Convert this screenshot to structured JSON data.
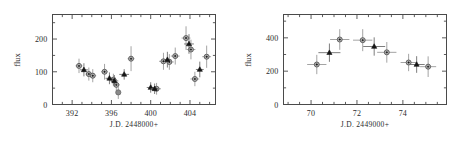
{
  "figure": {
    "background": "#ffffff",
    "panel_count": 2
  },
  "chart_data": [
    {
      "type": "scatter",
      "panel": "left",
      "title": "",
      "xlabel": "J.D. 2448000+",
      "ylabel": "flux",
      "xlim": [
        390.0,
        406.6
      ],
      "ylim": [
        0,
        275
      ],
      "xticks": [
        392,
        396,
        400,
        404
      ],
      "xticklabels": [
        "392",
        "396",
        "400",
        "404"
      ],
      "yticks": [
        0,
        100,
        200
      ],
      "yticklabels": [
        "0",
        "100",
        "200"
      ],
      "xminor_step": 1,
      "yminor_step": 50,
      "grid": false,
      "legend": null,
      "series": [
        {
          "name": "open-circle",
          "marker": "open-circle",
          "color": "#b3b3b3",
          "points": [
            {
              "x": 392.7,
              "y": 118,
              "yerr": 22,
              "xerr": 0.35
            },
            {
              "x": 393.7,
              "y": 93,
              "yerr": 20,
              "xerr": 0.35
            },
            {
              "x": 394.1,
              "y": 88,
              "yerr": 20,
              "xerr": 0.35
            },
            {
              "x": 395.3,
              "y": 100,
              "yerr": 24,
              "xerr": 0.35
            },
            {
              "x": 396.2,
              "y": 76,
              "yerr": 18,
              "xerr": 0.35
            },
            {
              "x": 396.5,
              "y": 60,
              "yerr": 18,
              "xerr": 0.35
            },
            {
              "x": 398.0,
              "y": 140,
              "yerr": 38,
              "xerr": 0.35
            },
            {
              "x": 400.6,
              "y": 48,
              "yerr": 18,
              "xerr": 0.45
            },
            {
              "x": 401.3,
              "y": 132,
              "yerr": 26,
              "xerr": 0.45
            },
            {
              "x": 401.9,
              "y": 130,
              "yerr": 24,
              "xerr": 0.45
            },
            {
              "x": 402.5,
              "y": 148,
              "yerr": 26,
              "xerr": 0.45
            },
            {
              "x": 403.6,
              "y": 203,
              "yerr": 36,
              "xerr": 0.45
            },
            {
              "x": 404.1,
              "y": 168,
              "yerr": 30,
              "xerr": 0.45
            },
            {
              "x": 404.5,
              "y": 78,
              "yerr": 22,
              "xerr": 0.45
            },
            {
              "x": 405.7,
              "y": 146,
              "yerr": 34,
              "xerr": 0.45
            }
          ]
        },
        {
          "name": "filled-triangle",
          "marker": "filled-triangle",
          "color": "#151515",
          "points": [
            {
              "x": 393.2,
              "y": 106,
              "yerr": 20,
              "xerr": 0.4
            },
            {
              "x": 395.8,
              "y": 80,
              "yerr": 18,
              "xerr": 0.4
            },
            {
              "x": 396.3,
              "y": 72,
              "yerr": 18,
              "xerr": 0.4
            },
            {
              "x": 397.3,
              "y": 92,
              "yerr": 16,
              "xerr": 0.5
            },
            {
              "x": 400.0,
              "y": 52,
              "yerr": 16,
              "xerr": 0.4
            },
            {
              "x": 400.4,
              "y": 48,
              "yerr": 16,
              "xerr": 0.4
            },
            {
              "x": 401.7,
              "y": 137,
              "yerr": 24,
              "xerr": 0.4
            },
            {
              "x": 403.9,
              "y": 185,
              "yerr": 30,
              "xerr": 0.5
            },
            {
              "x": 405.0,
              "y": 107,
              "yerr": 24,
              "xerr": 0.4
            }
          ]
        },
        {
          "name": "filled-gray-circle",
          "marker": "gray-circle",
          "color": "#8a8a8a",
          "points": [
            {
              "x": 396.7,
              "y": 37,
              "yerr": 20,
              "xerr": 0.0
            }
          ]
        }
      ]
    },
    {
      "type": "scatter",
      "panel": "right",
      "title": "",
      "xlabel": "J.D. 2449000+",
      "ylabel": "flux",
      "xlim": [
        68.8,
        75.9
      ],
      "ylim": [
        0,
        540
      ],
      "xticks": [
        70,
        72,
        74
      ],
      "xticklabels": [
        "70",
        "72",
        "74"
      ],
      "yticks": [
        0,
        200,
        400
      ],
      "yticklabels": [
        "0",
        "200",
        "400"
      ],
      "xminor_step": 0.5,
      "yminor_step": 100,
      "grid": false,
      "legend": null,
      "series": [
        {
          "name": "open-circle",
          "marker": "open-circle",
          "color": "#b3b3b3",
          "points": [
            {
              "x": 70.25,
              "y": 240,
              "yerr": 58,
              "xerr": 0.42
            },
            {
              "x": 71.25,
              "y": 390,
              "yerr": 62,
              "xerr": 0.42
            },
            {
              "x": 72.25,
              "y": 386,
              "yerr": 66,
              "xerr": 0.42
            },
            {
              "x": 73.3,
              "y": 313,
              "yerr": 62,
              "xerr": 0.42
            },
            {
              "x": 74.25,
              "y": 252,
              "yerr": 52,
              "xerr": 0.35
            },
            {
              "x": 75.1,
              "y": 227,
              "yerr": 62,
              "xerr": 0.35
            }
          ]
        },
        {
          "name": "filled-triangle",
          "marker": "filled-triangle",
          "color": "#151515",
          "points": [
            {
              "x": 70.8,
              "y": 311,
              "yerr": 55,
              "xerr": 0.48
            },
            {
              "x": 72.75,
              "y": 348,
              "yerr": 55,
              "xerr": 0.48
            },
            {
              "x": 74.6,
              "y": 240,
              "yerr": 50,
              "xerr": 0.35
            }
          ]
        }
      ]
    }
  ]
}
